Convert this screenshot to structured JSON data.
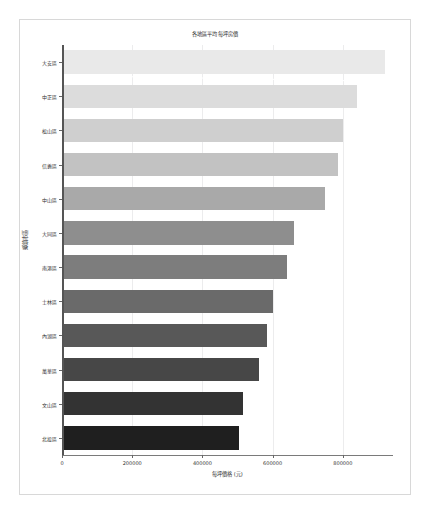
{
  "chart_data": {
    "type": "bar",
    "orientation": "horizontal",
    "title": "各地區平均每坪房價",
    "xlabel": "每坪價格 (元)",
    "ylabel": "鄉鎮市區",
    "categories": [
      "大安區",
      "中正區",
      "松山區",
      "信義區",
      "中山區",
      "大同區",
      "南港區",
      "士林區",
      "內湖區",
      "萬華區",
      "文山區",
      "北投區"
    ],
    "values": [
      920000,
      840000,
      800000,
      785000,
      750000,
      660000,
      640000,
      600000,
      585000,
      560000,
      515000,
      505000
    ],
    "xlim": [
      0,
      940000
    ],
    "xticks": [
      0,
      200000,
      400000,
      600000,
      800000
    ],
    "xtick_labels": [
      "0",
      "200000",
      "400000",
      "600000",
      "800000"
    ],
    "grid": true,
    "grid_axis": "x",
    "legend": false,
    "bar_colors": [
      "#e9e9e9",
      "#dcdcdc",
      "#cfcfcf",
      "#c2c2c2",
      "#a9a9a9",
      "#8e8e8e",
      "#7d7d7d",
      "#6a6a6a",
      "#585858",
      "#474747",
      "#333333",
      "#1f1f1f"
    ]
  },
  "figure": {
    "background_color": "#ffffff",
    "frame_color": "#d8d8d8",
    "axis_color": "#555555",
    "gridline_color": "#ececed"
  }
}
